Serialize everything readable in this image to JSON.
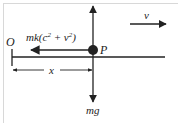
{
  "diagram": {
    "type": "free-body-diagram",
    "labels": {
      "origin": "O",
      "particle": "P",
      "resistance_force": "mk(c",
      "resistance_sup1": "2",
      "resistance_mid": " + v",
      "resistance_sup2": "2",
      "resistance_close": ")",
      "displacement": "x",
      "velocity": "v",
      "weight": "mg"
    },
    "colors": {
      "stroke": "#222222",
      "background": "#ffffff",
      "frame": "#d8d8d8"
    }
  }
}
